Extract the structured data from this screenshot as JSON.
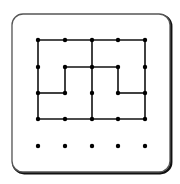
{
  "board": {
    "frame": {
      "x": 12,
      "y": 14,
      "width": 158,
      "height": 158,
      "radius": 11,
      "stroke": "#555555",
      "shadow": "#111111"
    },
    "line_color": "#111111",
    "dot_color": "#000000",
    "grid": {
      "columns_x": [
        38,
        65,
        92,
        118,
        145
      ],
      "rows_y": [
        40,
        67,
        93,
        119,
        146
      ]
    },
    "dots": [
      [
        0,
        0
      ],
      [
        1,
        0
      ],
      [
        2,
        0
      ],
      [
        3,
        0
      ],
      [
        4,
        0
      ],
      [
        0,
        1
      ],
      [
        1,
        1
      ],
      [
        2,
        1
      ],
      [
        3,
        1
      ],
      [
        4,
        1
      ],
      [
        0,
        2
      ],
      [
        1,
        2
      ],
      [
        2,
        2
      ],
      [
        3,
        2
      ],
      [
        4,
        2
      ],
      [
        0,
        3
      ],
      [
        1,
        3
      ],
      [
        2,
        3
      ],
      [
        3,
        3
      ],
      [
        4,
        3
      ],
      [
        0,
        4
      ],
      [
        1,
        4
      ],
      [
        2,
        4
      ],
      [
        3,
        4
      ],
      [
        4,
        4
      ]
    ],
    "segments": [
      [
        [
          0,
          0
        ],
        [
          4,
          0
        ]
      ],
      [
        [
          0,
          3
        ],
        [
          4,
          3
        ]
      ],
      [
        [
          0,
          0
        ],
        [
          0,
          3
        ]
      ],
      [
        [
          4,
          0
        ],
        [
          4,
          3
        ]
      ],
      [
        [
          2,
          0
        ],
        [
          2,
          3
        ]
      ],
      [
        [
          1,
          1
        ],
        [
          3,
          1
        ]
      ],
      [
        [
          1,
          1
        ],
        [
          1,
          2
        ]
      ],
      [
        [
          0,
          2
        ],
        [
          1,
          2
        ]
      ],
      [
        [
          3,
          1
        ],
        [
          3,
          2
        ]
      ],
      [
        [
          3,
          2
        ],
        [
          4,
          2
        ]
      ]
    ]
  }
}
